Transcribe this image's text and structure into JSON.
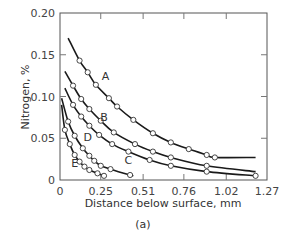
{
  "chart_data": {
    "type": "line",
    "title": "",
    "subtitle": "(a)",
    "xlabel": "Distance below surface, mm",
    "ylabel": "Nitrogen, %",
    "xlim": [
      0,
      1.27
    ],
    "ylim": [
      0,
      0.2
    ],
    "xticks": [
      0,
      0.25,
      0.51,
      0.76,
      1.02,
      1.27
    ],
    "xtick_labels": [
      "0",
      "0.25",
      "0.51",
      "0.76",
      "1.02",
      "1.27"
    ],
    "yticks": [
      0,
      0.05,
      0.1,
      0.15,
      0.2
    ],
    "ytick_labels": [
      "0",
      "0.05",
      "0.10",
      "0.15",
      "0.20"
    ],
    "grid": false,
    "legend": "inline curve labels",
    "marker": "open circle",
    "series": [
      {
        "name": "A",
        "curve": {
          "x": [
            0.05,
            1.2
          ],
          "y": [
            0.17,
            0.027
          ]
        },
        "points": [
          {
            "x": 0.12,
            "y": 0.143
          },
          {
            "x": 0.17,
            "y": 0.129
          },
          {
            "x": 0.22,
            "y": 0.114
          },
          {
            "x": 0.3,
            "y": 0.098
          },
          {
            "x": 0.35,
            "y": 0.088
          },
          {
            "x": 0.45,
            "y": 0.072
          },
          {
            "x": 0.57,
            "y": 0.056
          },
          {
            "x": 0.68,
            "y": 0.045
          },
          {
            "x": 0.79,
            "y": 0.037
          },
          {
            "x": 0.9,
            "y": 0.03
          },
          {
            "x": 0.95,
            "y": 0.027
          }
        ],
        "label_pos": {
          "x": 0.28,
          "y": 0.125
        }
      },
      {
        "name": "B",
        "curve": {
          "x": [
            0.03,
            1.2
          ],
          "y": [
            0.13,
            0.01
          ]
        },
        "points": [
          {
            "x": 0.08,
            "y": 0.113
          },
          {
            "x": 0.13,
            "y": 0.097
          },
          {
            "x": 0.18,
            "y": 0.085
          },
          {
            "x": 0.25,
            "y": 0.071
          },
          {
            "x": 0.33,
            "y": 0.057
          },
          {
            "x": 0.46,
            "y": 0.043
          },
          {
            "x": 0.57,
            "y": 0.034
          },
          {
            "x": 0.68,
            "y": 0.027
          },
          {
            "x": 0.9,
            "y": 0.017
          }
        ],
        "label_pos": {
          "x": 0.27,
          "y": 0.075
        }
      },
      {
        "name": "C",
        "curve": {
          "x": [
            0.03,
            1.2
          ],
          "y": [
            0.11,
            0.005
          ]
        },
        "points": [
          {
            "x": 0.08,
            "y": 0.09
          },
          {
            "x": 0.13,
            "y": 0.076
          },
          {
            "x": 0.18,
            "y": 0.065
          },
          {
            "x": 0.24,
            "y": 0.054
          },
          {
            "x": 0.32,
            "y": 0.043
          },
          {
            "x": 0.42,
            "y": 0.034
          },
          {
            "x": 0.55,
            "y": 0.024
          },
          {
            "x": 0.68,
            "y": 0.017
          },
          {
            "x": 0.9,
            "y": 0.01
          },
          {
            "x": 1.2,
            "y": 0.005
          }
        ],
        "label_pos": {
          "x": 0.42,
          "y": 0.024
        }
      },
      {
        "name": "D",
        "curve": {
          "x": [
            0.01,
            0.45
          ],
          "y": [
            0.098,
            0.005
          ]
        },
        "points": [
          {
            "x": 0.05,
            "y": 0.07
          },
          {
            "x": 0.09,
            "y": 0.053
          },
          {
            "x": 0.14,
            "y": 0.038
          },
          {
            "x": 0.18,
            "y": 0.029
          },
          {
            "x": 0.21,
            "y": 0.023
          },
          {
            "x": 0.25,
            "y": 0.017
          },
          {
            "x": 0.31,
            "y": 0.013
          },
          {
            "x": 0.43,
            "y": 0.006
          }
        ],
        "label_pos": {
          "x": 0.17,
          "y": 0.052
        }
      },
      {
        "name": "E",
        "curve": {
          "x": [
            0.01,
            0.28
          ],
          "y": [
            0.09,
            0.005
          ]
        },
        "points": [
          {
            "x": 0.03,
            "y": 0.06
          },
          {
            "x": 0.06,
            "y": 0.043
          },
          {
            "x": 0.09,
            "y": 0.03
          },
          {
            "x": 0.12,
            "y": 0.022
          },
          {
            "x": 0.15,
            "y": 0.016
          },
          {
            "x": 0.18,
            "y": 0.012
          },
          {
            "x": 0.23,
            "y": 0.008
          },
          {
            "x": 0.27,
            "y": 0.005
          }
        ],
        "label_pos": {
          "x": 0.09,
          "y": 0.02
        }
      }
    ]
  }
}
